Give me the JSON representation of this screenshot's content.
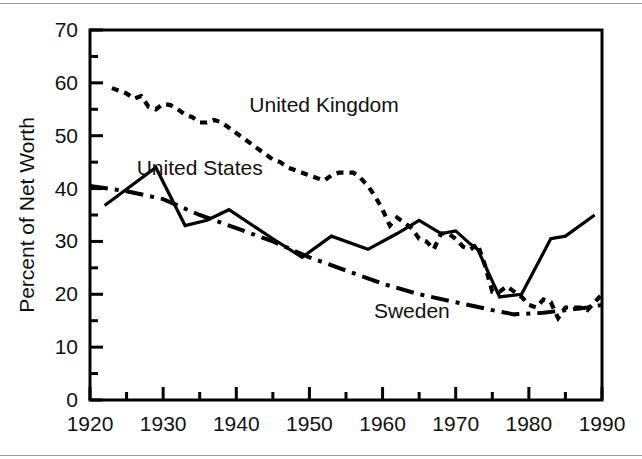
{
  "chart_data": {
    "type": "line",
    "title": "",
    "subtitle": "",
    "xlabel": "",
    "ylabel": "Percent of Net Worth",
    "xlim": [
      1920,
      1990
    ],
    "ylim": [
      0,
      70
    ],
    "grid": false,
    "legend_position": "inline-annotations",
    "x_ticks": [
      1920,
      1930,
      1940,
      1950,
      1960,
      1970,
      1980,
      1990
    ],
    "x_tick_labels": [
      "1920",
      "1930",
      "1940",
      "1950",
      "1960",
      "1970",
      "1980",
      "1990"
    ],
    "x_minor_ticks": [
      1925,
      1935,
      1945,
      1955,
      1965,
      1975,
      1985
    ],
    "y_ticks": [
      0,
      10,
      20,
      30,
      40,
      50,
      60,
      70
    ],
    "y_tick_labels": [
      "0",
      "10",
      "20",
      "30",
      "40",
      "50",
      "60",
      "70"
    ],
    "y_minor_ticks": [
      5,
      15,
      25,
      35,
      45,
      55,
      65
    ],
    "series": [
      {
        "name": "United Kingdom",
        "style": "dotted",
        "color": "#000000",
        "label_x": 1952,
        "label_y": 54.5,
        "points": [
          [
            1923,
            59.0
          ],
          [
            1924,
            58.5
          ],
          [
            1925,
            58.0
          ],
          [
            1926,
            57.0
          ],
          [
            1927,
            57.5
          ],
          [
            1928,
            55.5
          ],
          [
            1929,
            55.0
          ],
          [
            1930,
            56.0
          ],
          [
            1931,
            55.8
          ],
          [
            1932,
            55.0
          ],
          [
            1933,
            54.0
          ],
          [
            1934,
            53.5
          ],
          [
            1935,
            52.5
          ],
          [
            1936,
            52.5
          ],
          [
            1937,
            53.0
          ],
          [
            1938,
            52.5
          ],
          [
            1939,
            51.5
          ],
          [
            1940,
            50.5
          ],
          [
            1941,
            49.5
          ],
          [
            1942,
            48.5
          ],
          [
            1943,
            47.5
          ],
          [
            1944,
            46.5
          ],
          [
            1945,
            45.5
          ],
          [
            1946,
            45.0
          ],
          [
            1947,
            44.0
          ],
          [
            1948,
            43.5
          ],
          [
            1949,
            43.0
          ],
          [
            1950,
            42.5
          ],
          [
            1951,
            42.0
          ],
          [
            1952,
            41.5
          ],
          [
            1953,
            42.5
          ],
          [
            1954,
            43.0
          ],
          [
            1955,
            43.0
          ],
          [
            1956,
            43.0
          ],
          [
            1957,
            42.0
          ],
          [
            1958,
            40.5
          ],
          [
            1959,
            38.5
          ],
          [
            1960,
            36.0
          ],
          [
            1961,
            33.0
          ],
          [
            1962,
            34.5
          ],
          [
            1963,
            33.5
          ],
          [
            1964,
            32.5
          ],
          [
            1965,
            30.5
          ],
          [
            1966,
            30.0
          ],
          [
            1967,
            28.5
          ],
          [
            1968,
            31.5
          ],
          [
            1969,
            31.5
          ],
          [
            1970,
            30.5
          ],
          [
            1971,
            29.0
          ],
          [
            1972,
            28.5
          ],
          [
            1973,
            29.5
          ],
          [
            1974,
            25.5
          ],
          [
            1975,
            20.5
          ],
          [
            1976,
            20.5
          ],
          [
            1977,
            21.5
          ],
          [
            1978,
            20.5
          ],
          [
            1979,
            19.5
          ],
          [
            1980,
            18.0
          ],
          [
            1981,
            17.5
          ],
          [
            1982,
            19.0
          ],
          [
            1983,
            18.5
          ],
          [
            1984,
            15.5
          ],
          [
            1985,
            17.5
          ],
          [
            1986,
            17.5
          ],
          [
            1987,
            17.5
          ],
          [
            1988,
            17.0
          ],
          [
            1989,
            18.5
          ],
          [
            1990,
            20.0
          ]
        ]
      },
      {
        "name": "United States",
        "style": "solid",
        "color": "#000000",
        "label_x": 1935,
        "label_y": 42.5,
        "points": [
          [
            1922,
            36.8
          ],
          [
            1929,
            44.0
          ],
          [
            1933,
            33.0
          ],
          [
            1936,
            34.0
          ],
          [
            1939,
            36.0
          ],
          [
            1945,
            30.5
          ],
          [
            1949,
            27.0
          ],
          [
            1953,
            31.0
          ],
          [
            1958,
            28.5
          ],
          [
            1962,
            31.5
          ],
          [
            1965,
            34.0
          ],
          [
            1968,
            31.5
          ],
          [
            1970,
            32.0
          ],
          [
            1972,
            29.5
          ],
          [
            1973,
            28.5
          ],
          [
            1976,
            19.5
          ],
          [
            1979,
            20.0
          ],
          [
            1983,
            30.5
          ],
          [
            1985,
            31.0
          ],
          [
            1989,
            35.0
          ]
        ]
      },
      {
        "name": "Sweden",
        "style": "dash-dot",
        "color": "#000000",
        "label_x": 1964,
        "label_y": 15.5,
        "points": [
          [
            1920,
            40.5
          ],
          [
            1925,
            39.5
          ],
          [
            1930,
            38.0
          ],
          [
            1935,
            35.0
          ],
          [
            1940,
            32.5
          ],
          [
            1945,
            30.0
          ],
          [
            1950,
            27.0
          ],
          [
            1955,
            24.5
          ],
          [
            1960,
            22.0
          ],
          [
            1965,
            20.0
          ],
          [
            1970,
            18.5
          ],
          [
            1975,
            17.0
          ],
          [
            1978,
            16.2
          ],
          [
            1982,
            16.5
          ],
          [
            1985,
            17.0
          ],
          [
            1988,
            17.5
          ],
          [
            1990,
            18.0
          ]
        ]
      }
    ]
  },
  "labels": {
    "uk": "United Kingdom",
    "us": "United States",
    "sweden": "Sweden",
    "y_axis_title": "Percent of Net Worth"
  }
}
